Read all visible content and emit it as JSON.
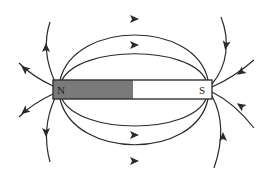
{
  "diagram": {
    "colors": {
      "background": "#ffffff",
      "line": "#2a2a2a",
      "magnet_outline": "#333333",
      "north_fill": "#7a7a7a",
      "south_fill": "#ffffff",
      "label": "#222222"
    },
    "magnet": {
      "x": 53,
      "y": 80,
      "width": 159,
      "height": 19,
      "split_x": 133,
      "north_label": "N",
      "south_label": "S"
    },
    "field_lines": [
      {
        "id": "top-outer-arc",
        "d": "M60 80 C 75 20, 195 20, 208 80",
        "arrow": {
          "x": 134,
          "y": 19,
          "angle": 0
        }
      },
      {
        "id": "top-inner-arc",
        "d": "M62 80 C 80 45, 190 45, 206 80",
        "arrow": {
          "x": 134,
          "y": 45,
          "angle": 0
        }
      },
      {
        "id": "bottom-inner-arc",
        "d": "M62 99 C 80 135, 190 135, 206 99",
        "arrow": {
          "x": 134,
          "y": 135,
          "angle": 0
        }
      },
      {
        "id": "bottom-outer-arc",
        "d": "M60 99 C 75 160, 195 160, 208 99",
        "arrow": {
          "x": 134,
          "y": 161,
          "angle": 0
        }
      },
      {
        "id": "north-up-line",
        "d": "M55 82 C 45 60, 44 40, 50 22",
        "arrow": {
          "x": 46,
          "y": 48,
          "angle": -90
        }
      },
      {
        "id": "north-upleft-line",
        "d": "M53 86 C 40 80, 28 72, 19 63",
        "arrow": {
          "x": 25,
          "y": 69,
          "angle": -140
        }
      },
      {
        "id": "north-downleft-line",
        "d": "M53 94 C 40 100, 28 108, 19 117",
        "arrow": {
          "x": 25,
          "y": 111,
          "angle": 140
        }
      },
      {
        "id": "north-down-line",
        "d": "M55 98 C 45 120, 44 140, 50 162",
        "arrow": {
          "x": 46,
          "y": 132,
          "angle": 90
        }
      },
      {
        "id": "south-up-line",
        "d": "M221 17 C 230 40, 228 65, 212 84",
        "arrow": {
          "x": 226,
          "y": 45,
          "angle": 100
        }
      },
      {
        "id": "south-upright-line",
        "d": "M254 60 C 240 72, 228 80, 212 87",
        "arrow": {
          "x": 241,
          "y": 72,
          "angle": 145
        }
      },
      {
        "id": "south-downright-line",
        "d": "M254 128 C 240 110, 228 100, 212 92",
        "arrow": {
          "x": 241,
          "y": 106,
          "angle": -145
        }
      },
      {
        "id": "south-down-line",
        "d": "M214 168 C 222 145, 225 120, 212 96",
        "arrow": {
          "x": 223,
          "y": 137,
          "angle": -90
        }
      }
    ]
  }
}
